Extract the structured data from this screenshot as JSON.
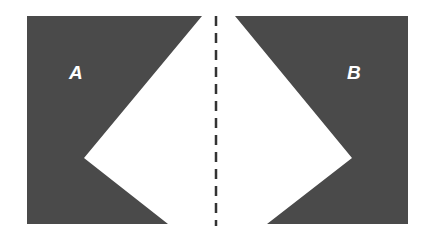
{
  "diagram": {
    "shape_a": {
      "label": "A",
      "color": "#4a4a4a",
      "points": "27,16 202,16 84,158 168,224 27,224"
    },
    "shape_b": {
      "label": "B",
      "color": "#4a4a4a",
      "points": "235,16 408,16 408,224 267,224 352,158"
    },
    "divider": {
      "style": "dashed",
      "x": 216,
      "color": "#333333"
    }
  }
}
